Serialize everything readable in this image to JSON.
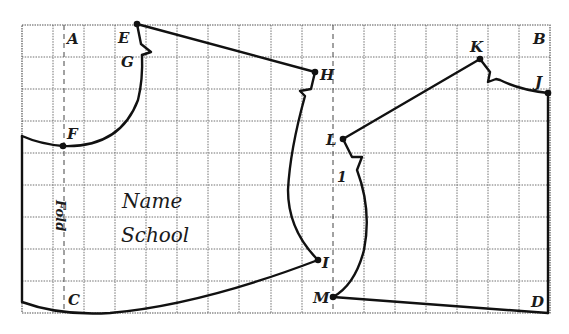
{
  "figure": {
    "type": "pattern draft on squared grid",
    "grid": {
      "columns": 17,
      "rows": 9,
      "x0": 22,
      "y0": 25,
      "x1": 550,
      "y1": 313,
      "line_color": "#6a6a6a",
      "style": "dotted"
    },
    "fold_lines": [
      {
        "label": "Fold",
        "x": 64
      },
      {
        "label": "",
        "x": 333
      }
    ],
    "corner_labels": {
      "A": "A",
      "B": "B",
      "C": "C",
      "D": "D"
    },
    "points": {
      "E": "E",
      "F": "F",
      "G": "G",
      "H": "H",
      "I": "I",
      "J": "J",
      "K": "K",
      "L": "L",
      "M": "M"
    },
    "fold_label": "Fold",
    "piece_number": "1",
    "name_label": "Name",
    "school_label": "School"
  }
}
